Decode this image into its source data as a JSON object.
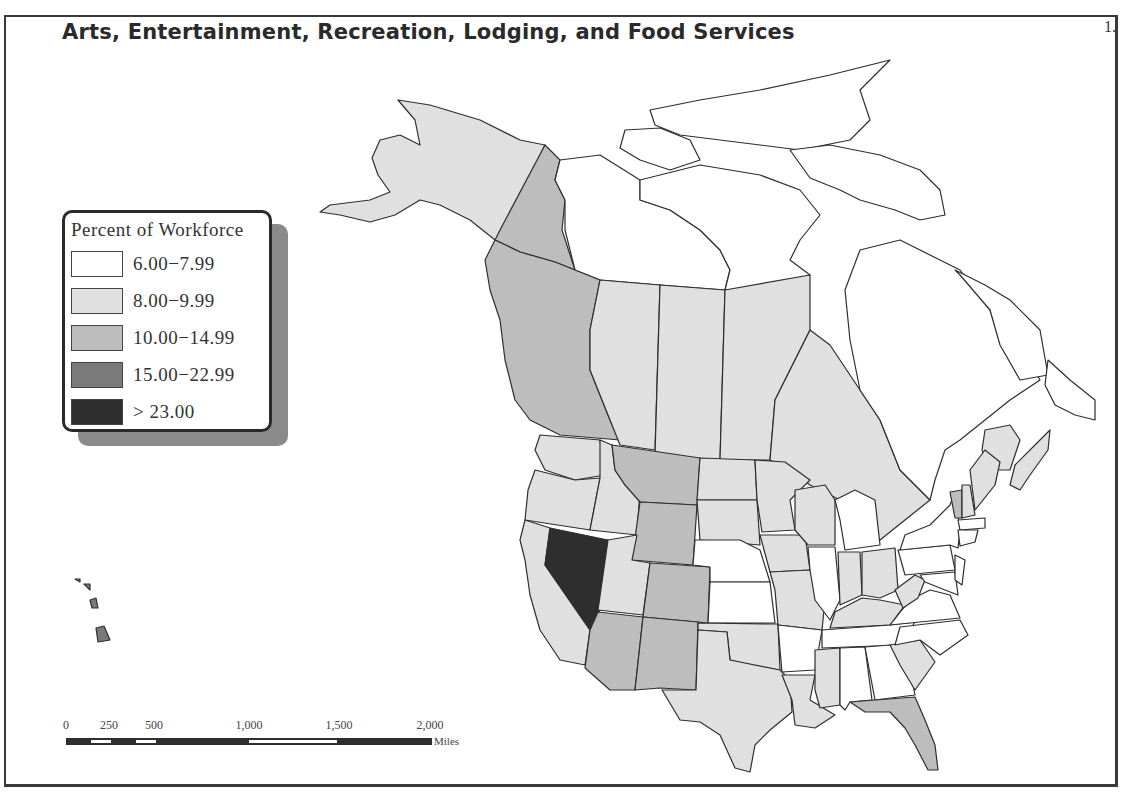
{
  "title": "Arts, Entertainment, Recreation, Lodging, and Food Services",
  "page_number": "1.",
  "legend": {
    "title": "Percent of Workforce",
    "classes": [
      {
        "label": "6.00−7.99",
        "color": "#ffffff"
      },
      {
        "label": "8.00−9.99",
        "color": "#e0e0e0"
      },
      {
        "label": "10.00−14.99",
        "color": "#bdbdbd"
      },
      {
        "label": "15.00−22.99",
        "color": "#7a7a7a"
      },
      {
        "label": "> 23.00",
        "color": "#2e2e2e"
      }
    ]
  },
  "scale_bar": {
    "ticks": [
      "0",
      "250",
      "500",
      "1,000",
      "1,500",
      "2,000"
    ],
    "unit": "Miles"
  },
  "regions": {
    "alaska": 1,
    "yukon": 2,
    "northwest_territories": 0,
    "nunavut": 0,
    "british_columbia": 2,
    "alberta": 1,
    "saskatchewan": 1,
    "manitoba": 1,
    "ontario": 1,
    "quebec": 0,
    "newfoundland_labrador": 0,
    "new_brunswick": 1,
    "nova_scotia": 1,
    "washington": 1,
    "oregon": 1,
    "california": 1,
    "nevada": 4,
    "idaho": 1,
    "montana": 2,
    "wyoming": 2,
    "utah": 1,
    "colorado": 2,
    "arizona": 2,
    "new_mexico": 2,
    "hawaii": 3,
    "north_dakota": 1,
    "south_dakota": 1,
    "nebraska": 0,
    "kansas": 0,
    "oklahoma": 1,
    "texas": 1,
    "minnesota": 1,
    "iowa": 1,
    "missouri": 1,
    "arkansas": 0,
    "louisiana": 1,
    "wisconsin": 1,
    "illinois": 0,
    "michigan": 0,
    "indiana": 1,
    "ohio": 1,
    "kentucky": 1,
    "tennessee": 0,
    "mississippi": 1,
    "alabama": 0,
    "georgia": 0,
    "florida": 2,
    "south_carolina": 1,
    "north_carolina": 0,
    "virginia": 0,
    "west_virginia": 1,
    "pennsylvania": 0,
    "new_york": 0,
    "vermont": 2,
    "new_hampshire": 1,
    "maine": 1,
    "massachusetts": 0,
    "connecticut": 0,
    "new_jersey": 0,
    "maryland": 0
  }
}
